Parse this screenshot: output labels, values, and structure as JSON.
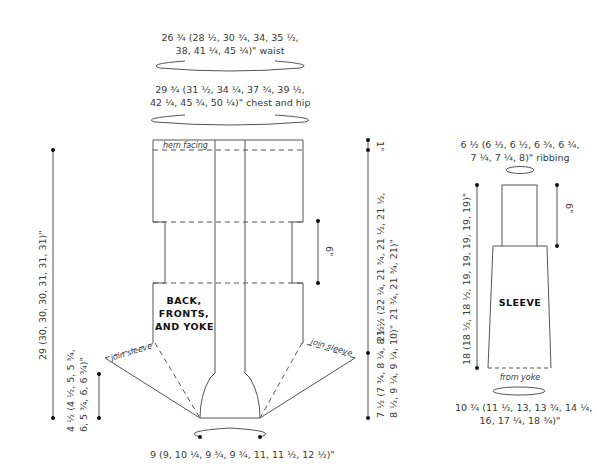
{
  "body_piece": {
    "title_lines": [
      "BACK,",
      "FRONTS,",
      "AND YOKE"
    ],
    "hem_label": "hem facing",
    "join_left": "join sleeve",
    "join_right": "join sleeve",
    "waist": {
      "line1": "26 ¾ (28 ½, 30 ¾, 34, 35 ½,",
      "line2": "38, 41 ¼, 45 ¼)\" waist"
    },
    "chest": {
      "line1": "29 ¾ (31 ½, 34 ¼, 37 ¾, 39 ½,",
      "line2": "42 ¼, 45 ¾, 50 ¼)\" chest and hip"
    },
    "neck": "9 (9, 10 ¼, 9 ¾, 9 ¾, 11, 11 ½, 12 ½)\"",
    "total_length": "29 (30, 30, 30, 31, 31, 31)\"",
    "yoke_depth": {
      "line1": "4 ½ (4 ½, 5, 5 ¾,",
      "line2": "6, 5 ¾, 6, 6 ¾)\""
    },
    "hem": "1\"",
    "waist_length": "6\"",
    "body_length": {
      "line1": "21 ½ (22 ¼, 21 ¾, 21 ½, 21 ½,",
      "line2": "21 ¾, 21 ¾, 21)\""
    },
    "armhole": {
      "line1": "7 ½ (7 ¾, 8 ¼, 8 ½,",
      "line2": "8 ½, 9 ¼, 9 ¼, 10)\""
    }
  },
  "sleeve_piece": {
    "title": "SLEEVE",
    "ribbing": {
      "line1": "6 ½ (6 ½, 6 ½, 6 ¾, 6 ¾,",
      "line2": "7 ¼, 7 ¼, 8)\" ribbing"
    },
    "length": "18 (18 ½, 18 ½, 19, 19, 19, 19, 19)\"",
    "cuff_length": "6\"",
    "from_yoke": "from yoke",
    "upper_arm": {
      "line1": "10 ¾ (11 ½, 13, 13 ¾, 14 ¼,",
      "line2": "16, 17 ¼, 18 ¾)\""
    }
  },
  "colors": {
    "line": "#555555",
    "text": "#3a3a3a",
    "dot": "#111111"
  }
}
